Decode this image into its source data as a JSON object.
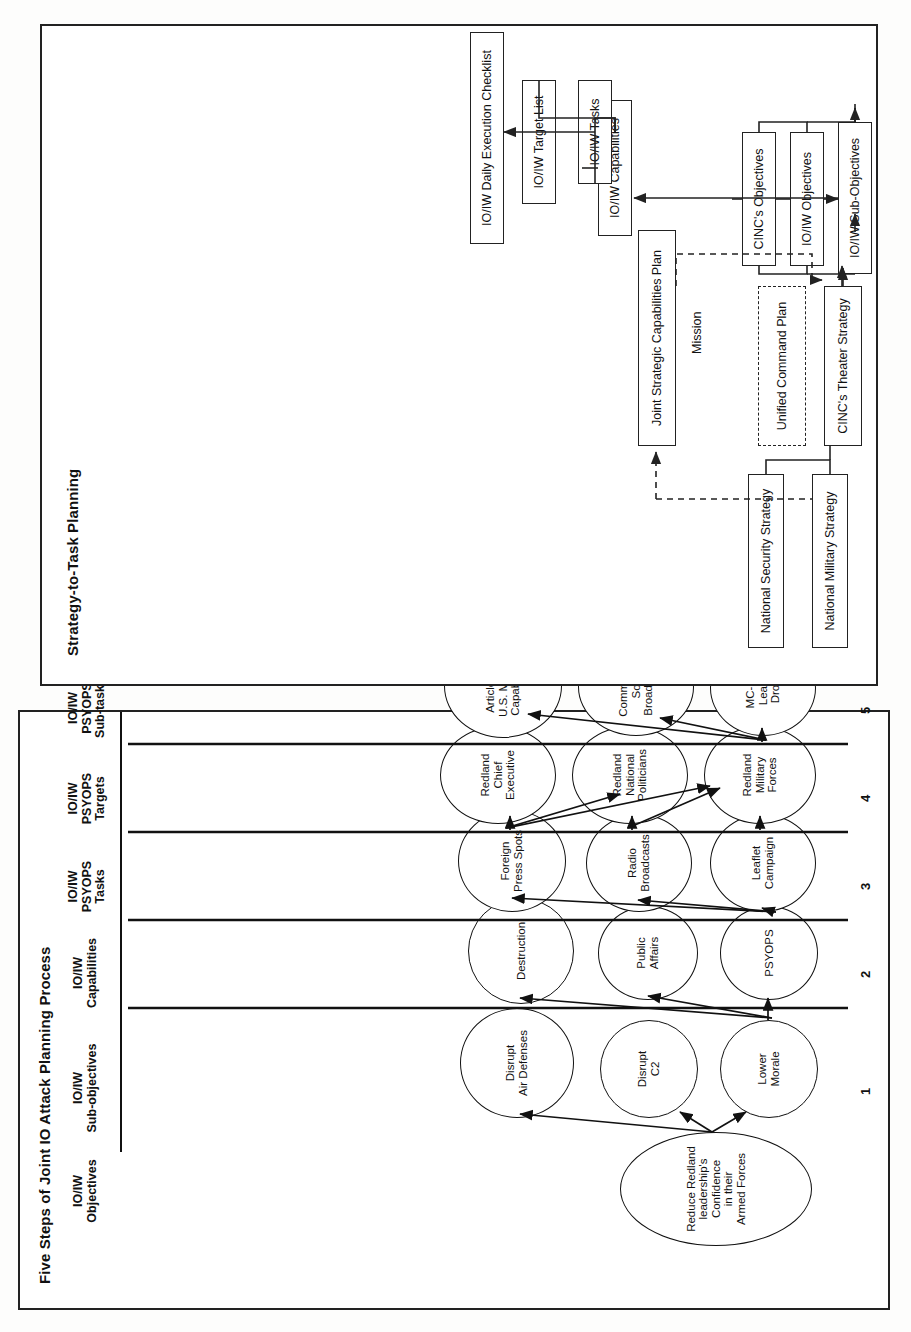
{
  "panels": {
    "steps": {
      "title": "Five Steps of Joint IO Attack Planning Process",
      "column_headers": [
        "IO/IW\nObjectives",
        "IO/IW\nSub-objectives",
        "IO/IW\nCapabilities",
        "IO/IW\nPSYOPS\nTasks",
        "IO/IW\nPSYOPS\nTargets",
        "IO/IW\nPSYOPS\nSub-tasks",
        "Equity\nReview"
      ],
      "step_numbers": [
        "1",
        "2",
        "3",
        "4",
        "5"
      ],
      "objective": "Reduce Redland\nleadership's Confidence\nin their\nArmed Forces",
      "sub_objectives": [
        "Lower\nMorale",
        "Disrupt\nC2",
        "Disrupt\nAir Defenses"
      ],
      "capabilities": [
        "PSYOPS",
        "Public\nAffairs",
        "Destruction"
      ],
      "psyops_tasks": [
        "Leaflet\nCampaign",
        "Radio\nBroadcasts",
        "Foreign\nPress Spots"
      ],
      "psyops_targets": [
        "Redland\nMilitary\nForces",
        "Redland\nNational\nPoliticians",
        "Redland\nChief\nExecutive"
      ],
      "psyops_subtasks": [
        "MC-130\nLeaflet\nDrops",
        "Commando\nSolo\nBroadcasts",
        "Articles on\nU.S. Military\nCapabilities"
      ],
      "equity_review_criteria": [
        "-Operational Gain Versus Intelligence Loss",
        "-Frequency Deconfliction",
        "-Security Compromise (OPSEC)",
        "-Other Criteria as Established by the Command"
      ]
    },
    "strategy_to_task": {
      "title": "Strategy-to-Task Planning",
      "boxes": [
        "National Security Strategy",
        "National Military Strategy",
        "Joint Strategic Capabilities Plan",
        "Unified Command Plan",
        "CINC's Theater Strategy",
        "CINC's Objectives",
        "IO/IW Objectives",
        "IO/IW Sub-Objectives",
        "IO/IW Capabilities",
        "IO/IW Target List",
        "IO/IW Tasks",
        "IO/IW Daily Execution Checklist"
      ],
      "edge_label": "Mission"
    }
  },
  "colors": {
    "ink": "#111111",
    "paper": "#ffffff",
    "page": "#fdfdfc"
  }
}
